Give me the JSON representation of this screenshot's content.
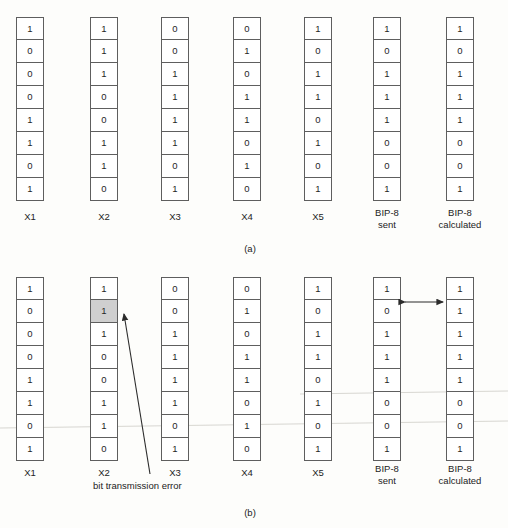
{
  "figure": {
    "rows": 8,
    "bit_width": 28,
    "cell_height": 23,
    "highlight_color": "#cfcfcf",
    "line_color": "#5e5e5e",
    "background": "#fdfdfb"
  },
  "panels": [
    {
      "caption": "(a)",
      "columns": [
        {
          "label_line1": "X1",
          "label_line2": "",
          "bits": [
            "1",
            "0",
            "0",
            "0",
            "1",
            "1",
            "0",
            "1"
          ],
          "highlight_row": -1
        },
        {
          "label_line1": "X2",
          "label_line2": "",
          "bits": [
            "1",
            "1",
            "1",
            "0",
            "0",
            "1",
            "1",
            "0"
          ],
          "highlight_row": -1
        },
        {
          "label_line1": "X3",
          "label_line2": "",
          "bits": [
            "0",
            "0",
            "1",
            "1",
            "1",
            "1",
            "0",
            "1"
          ],
          "highlight_row": -1
        },
        {
          "label_line1": "X4",
          "label_line2": "",
          "bits": [
            "0",
            "1",
            "0",
            "1",
            "1",
            "0",
            "1",
            "0"
          ],
          "highlight_row": -1
        },
        {
          "label_line1": "X5",
          "label_line2": "",
          "bits": [
            "1",
            "0",
            "1",
            "1",
            "0",
            "1",
            "0",
            "1"
          ],
          "highlight_row": -1
        },
        {
          "label_line1": "BIP-8",
          "label_line2": "sent",
          "bits": [
            "1",
            "0",
            "1",
            "1",
            "1",
            "0",
            "0",
            "1"
          ],
          "highlight_row": -1
        },
        {
          "label_line1": "BIP-8",
          "label_line2": "calculated",
          "bits": [
            "1",
            "0",
            "1",
            "1",
            "1",
            "0",
            "0",
            "1"
          ],
          "highlight_row": -1
        }
      ]
    },
    {
      "caption": "(b)",
      "annotation": "bit transmission error",
      "columns": [
        {
          "label_line1": "X1",
          "label_line2": "",
          "bits": [
            "1",
            "0",
            "0",
            "0",
            "1",
            "1",
            "0",
            "1"
          ],
          "highlight_row": -1
        },
        {
          "label_line1": "X2",
          "label_line2": "",
          "bits": [
            "1",
            "1",
            "1",
            "0",
            "0",
            "1",
            "1",
            "0"
          ],
          "highlight_row": 1
        },
        {
          "label_line1": "X3",
          "label_line2": "",
          "bits": [
            "0",
            "0",
            "1",
            "1",
            "1",
            "1",
            "0",
            "1"
          ],
          "highlight_row": -1
        },
        {
          "label_line1": "X4",
          "label_line2": "",
          "bits": [
            "0",
            "1",
            "0",
            "1",
            "1",
            "0",
            "1",
            "0"
          ],
          "highlight_row": -1
        },
        {
          "label_line1": "X5",
          "label_line2": "",
          "bits": [
            "1",
            "0",
            "1",
            "1",
            "0",
            "1",
            "0",
            "1"
          ],
          "highlight_row": -1
        },
        {
          "label_line1": "BIP-8",
          "label_line2": "sent",
          "bits": [
            "1",
            "0",
            "1",
            "1",
            "1",
            "0",
            "0",
            "1"
          ],
          "highlight_row": -1
        },
        {
          "label_line1": "BIP-8",
          "label_line2": "calculated",
          "bits": [
            "1",
            "1",
            "1",
            "1",
            "1",
            "0",
            "0",
            "1"
          ],
          "highlight_row": -1
        }
      ]
    }
  ]
}
